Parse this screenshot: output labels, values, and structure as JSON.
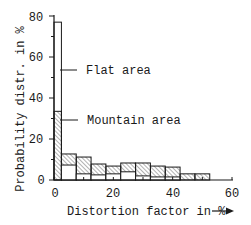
{
  "chart_data": {
    "type": "bar",
    "subtype": "overlaid-histogram",
    "title": "",
    "xlabel": "Distortion factor in %",
    "ylabel": "Probability distr. in %",
    "xlim": [
      0,
      60
    ],
    "ylim": [
      0,
      80
    ],
    "x_ticks": [
      0,
      20,
      40,
      60
    ],
    "x_minor_ticks": [
      10,
      30,
      50
    ],
    "y_ticks": [
      0,
      20,
      40,
      60,
      80
    ],
    "y_minor_ticks": [
      10,
      30,
      50,
      70
    ],
    "grid": false,
    "bins": [
      [
        0,
        2.5
      ],
      [
        2.5,
        7.5
      ],
      [
        7.5,
        12.5
      ],
      [
        12.5,
        17.5
      ],
      [
        17.5,
        22.5
      ],
      [
        22.5,
        27.5
      ],
      [
        27.5,
        32.5
      ],
      [
        32.5,
        37.5
      ],
      [
        37.5,
        42.5
      ],
      [
        42.5,
        47.5
      ],
      [
        47.5,
        52.5
      ]
    ],
    "series": [
      {
        "name": "Flat area",
        "style": "white",
        "values": [
          77,
          7.3,
          3,
          2.5,
          3,
          4,
          2,
          1.5,
          1.5,
          0,
          0
        ]
      },
      {
        "name": "Mountain area",
        "style": "hatched",
        "values": [
          33.5,
          12.7,
          11.2,
          7.8,
          6.8,
          8.3,
          8.3,
          6.8,
          6.3,
          3,
          3
        ]
      }
    ],
    "annotations": [
      {
        "text": "Flat area",
        "points_to": "Flat area bin 0-2.5",
        "y": 54
      },
      {
        "text": "Mountain area",
        "points_to": "Mountain area bin 0-2.5",
        "y": 29
      }
    ],
    "legend": "inline annotations with leader lines"
  },
  "labels": {
    "xlabel": "Distortion factor in %",
    "ylabel": "Probability distr. in %",
    "flat": "Flat area",
    "mountain": "Mountain area",
    "yt0": "0",
    "yt20": "20",
    "yt40": "40",
    "yt60": "60",
    "yt80": "80",
    "xt0": "0",
    "xt20": "20",
    "xt40": "40",
    "xt60": "60"
  }
}
